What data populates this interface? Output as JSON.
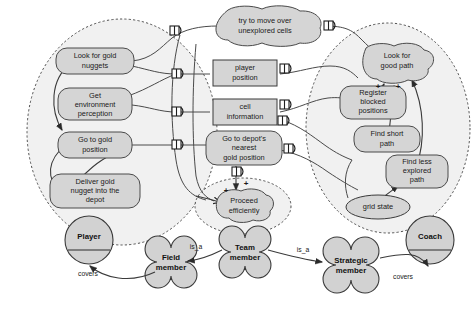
{
  "diagram": {
    "colors": {
      "node_fill": "#d5d5d5",
      "node_stroke": "#4a4a4a",
      "scope_fill": "#f1f1f1",
      "scope_stroke": "#4f4f4f",
      "background": "#ffffff",
      "text": "#1a1a1a"
    },
    "goals_left": [
      {
        "id": "look-for-gold-nuggets",
        "label": "Look for gold\nnuggets"
      },
      {
        "id": "get-environment-perception",
        "label": "Get\nenvironment\nperception"
      },
      {
        "id": "go-to-gold-position",
        "label": "Go to gold\nposition"
      },
      {
        "id": "deliver-gold-nugget",
        "label": "Deliver gold\nnugget into the\ndepot"
      }
    ],
    "goals_center": [
      {
        "id": "try-to-move-over-unexplored-cells",
        "label": "try to move over\nunexplored cells",
        "shape": "softgoal"
      },
      {
        "id": "go-to-depots-nearest-gold-position",
        "label": "Go to depot's\nnearest\ngold position",
        "shape": "goal"
      },
      {
        "id": "proceed-efficiently",
        "label": "Proceed\nefficiently",
        "shape": "softgoal"
      }
    ],
    "goals_right": [
      {
        "id": "look-for-good-path",
        "label": "Look for\ngood path",
        "shape": "softgoal"
      },
      {
        "id": "register-blocked-positions",
        "label": "Register\nblocked\npositions",
        "shape": "goal"
      },
      {
        "id": "find-short-path",
        "label": "Find short\npath",
        "shape": "goal"
      },
      {
        "id": "find-less-explored-path",
        "label": "Find less\nexplored\npath",
        "shape": "goal"
      }
    ],
    "resources": [
      {
        "id": "player-position",
        "label": "player\nposition",
        "shape": "rect"
      },
      {
        "id": "cell-information",
        "label": "cell\ninformation",
        "shape": "rect"
      },
      {
        "id": "grid-state",
        "label": "grid state",
        "shape": "ellipse"
      }
    ],
    "roles": [
      {
        "id": "player",
        "label": "Player",
        "shape": "circle-role"
      },
      {
        "id": "field-member",
        "label": "Field\nmember",
        "shape": "cloverleaf"
      },
      {
        "id": "team-member",
        "label": "Team\nmember",
        "shape": "cloverleaf"
      },
      {
        "id": "strategic-member",
        "label": "Strategic\nmember",
        "shape": "cloverleaf"
      },
      {
        "id": "coach",
        "label": "Coach",
        "shape": "circle-role"
      }
    ],
    "edge_labels": [
      {
        "id": "covers-player",
        "label": "covers"
      },
      {
        "id": "is-a-field",
        "label": "is_a"
      },
      {
        "id": "is-a-strategic",
        "label": "is_a"
      },
      {
        "id": "covers-coach",
        "label": "covers"
      }
    ],
    "contribution_marks": [
      {
        "id": "plus-proceed-left",
        "label": "+"
      },
      {
        "id": "plus-proceed-top",
        "label": "+"
      },
      {
        "id": "plus-path-left",
        "label": "+"
      },
      {
        "id": "plus-path-right",
        "label": "+"
      }
    ],
    "scopes": [
      {
        "id": "player-scope",
        "label": ""
      },
      {
        "id": "coach-scope",
        "label": ""
      },
      {
        "id": "proceed-scope",
        "label": ""
      }
    ]
  }
}
